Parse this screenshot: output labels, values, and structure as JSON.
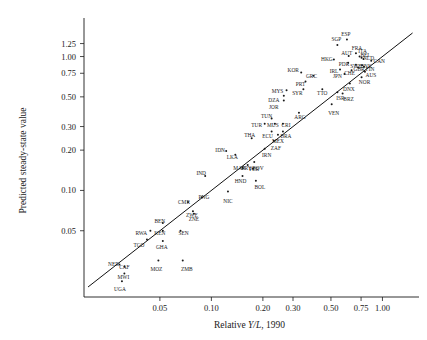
{
  "chart_data": {
    "type": "scatter",
    "title": "",
    "xlabel": "Relative Y/L, 1990",
    "xlabel_parts": {
      "pre": "Relative ",
      "italic": "Y/L",
      "post": ", 1990"
    },
    "ylabel": "Predicted steady-state value",
    "xscale": "log",
    "yscale": "log",
    "grid": false,
    "legend": "none",
    "xlim": [
      0.018,
      1.55
    ],
    "ylim": [
      0.016,
      1.75
    ],
    "xticks": [
      0.05,
      0.1,
      0.2,
      0.3,
      0.5,
      0.75,
      1.0
    ],
    "xticklabels": [
      "0.05",
      "0.10",
      "0.20",
      "0.30",
      "0.50",
      "0.75",
      "1.00"
    ],
    "yticks": [
      0.05,
      0.1,
      0.2,
      0.3,
      0.5,
      0.75,
      1.0,
      1.25
    ],
    "yticklabels": [
      "0.05",
      "0.10",
      "0.20",
      "0.30",
      "0.50",
      "0.75",
      "1.00",
      "1.25"
    ],
    "fit_line": {
      "type": "45-degree",
      "x0": 0.019,
      "y0": 0.019,
      "x1": 1.5,
      "y1": 1.5
    },
    "points": [
      {
        "label": "ESP",
        "x": 0.62,
        "y": 1.34,
        "lx": -1,
        "ly": -4
      },
      {
        "label": "SGP",
        "x": 0.545,
        "y": 1.22,
        "lx": -1,
        "ly": -4
      },
      {
        "label": "HKG",
        "x": 0.52,
        "y": 0.95,
        "lx": -7,
        "ly": 1
      },
      {
        "label": "AUT",
        "x": 0.635,
        "y": 1.01,
        "lx": -2,
        "ly": -1
      },
      {
        "label": "FRA",
        "x": 0.7,
        "y": 1.06,
        "lx": 1,
        "ly": -3
      },
      {
        "label": "ITA",
        "x": 0.735,
        "y": 1.0,
        "lx": 3,
        "ly": -4
      },
      {
        "label": "BEL",
        "x": 0.755,
        "y": 0.98,
        "lx": 4,
        "ly": -1
      },
      {
        "label": "NLD",
        "x": 0.775,
        "y": 0.96,
        "lx": 5,
        "ly": 1
      },
      {
        "label": "CAN",
        "x": 0.86,
        "y": 0.93,
        "lx": 8,
        "ly": 2
      },
      {
        "label": "PDR",
        "x": 0.63,
        "y": 0.9,
        "lx": -4,
        "ly": 3
      },
      {
        "label": "IRL",
        "x": 0.565,
        "y": 0.8,
        "lx": -6,
        "ly": 3
      },
      {
        "label": "SWE",
        "x": 0.7,
        "y": 0.87,
        "lx": 0,
        "ly": 3
      },
      {
        "label": "GBR",
        "x": 0.72,
        "y": 0.83,
        "lx": 1,
        "ly": 4
      },
      {
        "label": "DNK",
        "x": 0.76,
        "y": 0.86,
        "lx": 4,
        "ly": 3
      },
      {
        "label": "FIN",
        "x": 0.78,
        "y": 0.84,
        "lx": 6,
        "ly": 4
      },
      {
        "label": "JPN",
        "x": 0.6,
        "y": 0.74,
        "lx": -7,
        "ly": 4
      },
      {
        "label": "CHE",
        "x": 0.66,
        "y": 0.79,
        "lx": -2,
        "ly": 5
      },
      {
        "label": "AUS",
        "x": 0.79,
        "y": 0.77,
        "lx": 6,
        "ly": 5
      },
      {
        "label": "NOR",
        "x": 0.755,
        "y": 0.7,
        "lx": 3,
        "ly": 7
      },
      {
        "label": "DNX",
        "x": 0.645,
        "y": 0.63,
        "lx": -1,
        "ly": 8
      },
      {
        "label": "KOR",
        "x": 0.335,
        "y": 0.76,
        "lx": -8,
        "ly": 0
      },
      {
        "label": "GRC",
        "x": 0.395,
        "y": 0.72,
        "lx": -2,
        "ly": 2
      },
      {
        "label": "PRT",
        "x": 0.355,
        "y": 0.65,
        "lx": -5,
        "ly": 4
      },
      {
        "label": "SYR",
        "x": 0.345,
        "y": 0.57,
        "lx": -6,
        "ly": 6
      },
      {
        "label": "TTO",
        "x": 0.445,
        "y": 0.57,
        "lx": 0,
        "ly": 6
      },
      {
        "label": "ISR",
        "x": 0.545,
        "y": 0.54,
        "lx": 3,
        "ly": 8
      },
      {
        "label": "BRZ",
        "x": 0.585,
        "y": 0.53,
        "lx": 6,
        "ly": 8
      },
      {
        "label": "MYS",
        "x": 0.275,
        "y": 0.56,
        "lx": -9,
        "ly": 3
      },
      {
        "label": "DZA",
        "x": 0.265,
        "y": 0.51,
        "lx": -10,
        "ly": 6
      },
      {
        "label": "JOR",
        "x": 0.265,
        "y": 0.47,
        "lx": -10,
        "ly": 9
      },
      {
        "label": "VEN",
        "x": 0.505,
        "y": 0.44,
        "lx": 2,
        "ly": 11
      },
      {
        "label": "ARG",
        "x": 0.325,
        "y": 0.38,
        "lx": 1,
        "ly": 6
      },
      {
        "label": "TUN",
        "x": 0.225,
        "y": 0.345,
        "lx": -5,
        "ly": 0
      },
      {
        "label": "TUR",
        "x": 0.205,
        "y": 0.315,
        "lx": -8,
        "ly": 3
      },
      {
        "label": "MUS",
        "x": 0.235,
        "y": 0.315,
        "lx": -2,
        "ly": 3
      },
      {
        "label": "CRI",
        "x": 0.262,
        "y": 0.315,
        "lx": 3,
        "ly": 3
      },
      {
        "label": "ECU",
        "x": 0.225,
        "y": 0.275,
        "lx": -4,
        "ly": 6
      },
      {
        "label": "BRA",
        "x": 0.262,
        "y": 0.275,
        "lx": 3,
        "ly": 6
      },
      {
        "label": "MEX",
        "x": 0.245,
        "y": 0.26,
        "lx": 0,
        "ly": 8
      },
      {
        "label": "THA",
        "x": 0.172,
        "y": 0.245,
        "lx": -2,
        "ly": -1
      },
      {
        "label": "ZAF",
        "x": 0.232,
        "y": 0.235,
        "lx": 2,
        "ly": 9
      },
      {
        "label": "IRN",
        "x": 0.205,
        "y": 0.205,
        "lx": 2,
        "ly": 8
      },
      {
        "label": "IDN",
        "x": 0.122,
        "y": 0.197,
        "lx": -6,
        "ly": 1
      },
      {
        "label": "LKA",
        "x": 0.138,
        "y": 0.185,
        "lx": -3,
        "ly": 4
      },
      {
        "label": "PER",
        "x": 0.178,
        "y": 0.163,
        "lx": 0,
        "ly": 9
      },
      {
        "label": "PRY",
        "x": 0.163,
        "y": 0.155,
        "lx": -1,
        "ly": 5
      },
      {
        "label": "MAR",
        "x": 0.152,
        "y": 0.148,
        "lx": -3,
        "ly": 2
      },
      {
        "label": "BOV",
        "x": 0.175,
        "y": 0.145,
        "lx": 5,
        "ly": 1
      },
      {
        "label": "HND",
        "x": 0.152,
        "y": 0.128,
        "lx": -2,
        "ly": 7
      },
      {
        "label": "BOL",
        "x": 0.182,
        "y": 0.118,
        "lx": 4,
        "ly": 8
      },
      {
        "label": "IND",
        "x": 0.092,
        "y": 0.128,
        "lx": -4,
        "ly": -1
      },
      {
        "label": "NIC",
        "x": 0.125,
        "y": 0.098,
        "lx": 0,
        "ly": 11
      },
      {
        "label": "PNG",
        "x": 0.088,
        "y": 0.089,
        "lx": 2,
        "ly": 2
      },
      {
        "label": "CMR",
        "x": 0.073,
        "y": 0.082,
        "lx": -4,
        "ly": 2
      },
      {
        "label": "ZWE",
        "x": 0.078,
        "y": 0.07,
        "lx": -1,
        "ly": 6
      },
      {
        "label": "ZNE",
        "x": 0.079,
        "y": 0.067,
        "lx": 0,
        "ly": 7
      },
      {
        "label": "BEN",
        "x": 0.052,
        "y": 0.057,
        "lx": -3,
        "ly": 0
      },
      {
        "label": "KEN",
        "x": 0.052,
        "y": 0.05,
        "lx": -3,
        "ly": 4
      },
      {
        "label": "SEN",
        "x": 0.066,
        "y": 0.05,
        "lx": 3,
        "ly": 4
      },
      {
        "label": "RWA",
        "x": 0.044,
        "y": 0.05,
        "lx": -9,
        "ly": 4
      },
      {
        "label": "TGO",
        "x": 0.042,
        "y": 0.043,
        "lx": -8,
        "ly": 7
      },
      {
        "label": "GHA",
        "x": 0.052,
        "y": 0.042,
        "lx": -1,
        "ly": 8
      },
      {
        "label": "MOZ",
        "x": 0.049,
        "y": 0.03,
        "lx": -2,
        "ly": 11
      },
      {
        "label": "ZMB",
        "x": 0.068,
        "y": 0.03,
        "lx": 4,
        "ly": 11
      },
      {
        "label": "NER",
        "x": 0.029,
        "y": 0.028,
        "lx": -6,
        "ly": 2
      },
      {
        "label": "CAF",
        "x": 0.031,
        "y": 0.027,
        "lx": 0,
        "ly": 2
      },
      {
        "label": "MWI",
        "x": 0.031,
        "y": 0.024,
        "lx": -1,
        "ly": 6
      },
      {
        "label": "UGA",
        "x": 0.03,
        "y": 0.021,
        "lx": -2,
        "ly": 10
      }
    ]
  }
}
